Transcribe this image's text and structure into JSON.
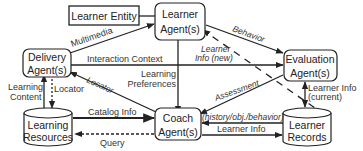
{
  "nodes": {
    "learner_entity": {
      "label": "Learner Entity"
    },
    "learner_agent": {
      "line1": "Learner",
      "line2": "Agent(s)"
    },
    "delivery_agent": {
      "line1": "Delivery",
      "line2": "Agent(s)"
    },
    "evaluation_agent": {
      "line1": "Evaluation",
      "line2": "Agent(s)"
    },
    "coach_agent": {
      "line1": "Coach",
      "line2": "Agent(s)"
    },
    "learning_resources": {
      "line1": "Learning",
      "line2": "Resources"
    },
    "learner_records": {
      "line1": "Learner",
      "line2": "Records"
    }
  },
  "edges": {
    "multimedia": "Multimedia",
    "behavior": "Behavior",
    "interaction_context": "Interaction Context",
    "learner_info_new_1": "Learner",
    "learner_info_new_2": "Info (new)",
    "learning_content_1": "Learning",
    "learning_content_2": "Content",
    "locator_vertical": "Locator",
    "locator_diag": "Locator",
    "learning_preferences_1": "Learning",
    "learning_preferences_2": "Preferences",
    "assessment": "Assessment",
    "learner_info_current_1": "Learner Info",
    "learner_info_current_2": "(current)",
    "catalog_info": "Catalog Info",
    "history": "(history/obj./behavior)",
    "query": "Query",
    "learner_info": "Learner Info"
  },
  "colors": {
    "stroke": "#222222",
    "text": "#222222",
    "background": "#ffffff"
  }
}
